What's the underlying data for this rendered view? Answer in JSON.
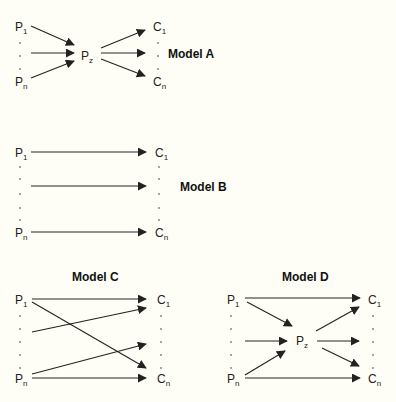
{
  "colors": {
    "background": "#fefef6",
    "ink": "#222222"
  },
  "models": [
    {
      "id": "A",
      "title": "Model A",
      "title_pos": [
        168,
        58
      ],
      "nodes": [
        {
          "id": "P1",
          "main": "P",
          "sub": "1",
          "x": 15,
          "y": 31
        },
        {
          "id": "Pn",
          "main": "P",
          "sub": "n",
          "x": 15,
          "y": 86
        },
        {
          "id": "Pz",
          "main": "P",
          "sub": "z",
          "x": 81,
          "y": 60
        },
        {
          "id": "C1",
          "main": "C",
          "sub": "1",
          "x": 153,
          "y": 31
        },
        {
          "id": "Cn",
          "main": "C",
          "sub": "n",
          "x": 153,
          "y": 86
        }
      ],
      "dots": [
        [
          20,
          43
        ],
        [
          20,
          56
        ],
        [
          20,
          69
        ],
        [
          158,
          43
        ],
        [
          158,
          56
        ],
        [
          158,
          69
        ]
      ],
      "edges": [
        {
          "from": [
            31,
            26
          ],
          "to": [
            74,
            45
          ]
        },
        {
          "from": [
            31,
            53
          ],
          "to": [
            74,
            53
          ]
        },
        {
          "from": [
            31,
            78
          ],
          "to": [
            74,
            61
          ]
        },
        {
          "from": [
            101,
            48
          ],
          "to": [
            145,
            30
          ]
        },
        {
          "from": [
            101,
            53
          ],
          "to": [
            145,
            53
          ]
        },
        {
          "from": [
            101,
            59
          ],
          "to": [
            145,
            76
          ]
        }
      ]
    },
    {
      "id": "B",
      "title": "Model B",
      "title_pos": [
        180,
        191
      ],
      "nodes": [
        {
          "id": "P1",
          "main": "P",
          "sub": "1",
          "x": 15,
          "y": 157
        },
        {
          "id": "Pn",
          "main": "P",
          "sub": "n",
          "x": 15,
          "y": 237
        },
        {
          "id": "C1",
          "main": "C",
          "sub": "1",
          "x": 155,
          "y": 157
        },
        {
          "id": "Cn",
          "main": "C",
          "sub": "n",
          "x": 155,
          "y": 237
        }
      ],
      "dots": [
        [
          20,
          167
        ],
        [
          20,
          179
        ],
        [
          20,
          194
        ],
        [
          20,
          208
        ],
        [
          20,
          220
        ],
        [
          159,
          167
        ],
        [
          159,
          179
        ],
        [
          159,
          194
        ],
        [
          159,
          208
        ],
        [
          159,
          220
        ]
      ],
      "edges": [
        {
          "from": [
            31,
            152
          ],
          "to": [
            146,
            152
          ]
        },
        {
          "from": [
            31,
            186
          ],
          "to": [
            146,
            186
          ]
        },
        {
          "from": [
            31,
            232
          ],
          "to": [
            146,
            232
          ]
        }
      ]
    },
    {
      "id": "C",
      "title": "Model C",
      "title_pos": [
        72,
        281
      ],
      "nodes": [
        {
          "id": "P1",
          "main": "P",
          "sub": "1",
          "x": 15,
          "y": 304
        },
        {
          "id": "Pn",
          "main": "P",
          "sub": "n",
          "x": 15,
          "y": 383
        },
        {
          "id": "C1",
          "main": "C",
          "sub": "1",
          "x": 157,
          "y": 304
        },
        {
          "id": "Cn",
          "main": "C",
          "sub": "n",
          "x": 157,
          "y": 383
        }
      ],
      "dots": [
        [
          20,
          316
        ],
        [
          20,
          329
        ],
        [
          20,
          342
        ],
        [
          20,
          355
        ],
        [
          20,
          368
        ],
        [
          161,
          316
        ],
        [
          161,
          329
        ],
        [
          161,
          342
        ],
        [
          161,
          355
        ],
        [
          161,
          368
        ]
      ],
      "edges": [
        {
          "from": [
            32,
            299
          ],
          "to": [
            146,
            299
          ]
        },
        {
          "from": [
            32,
            302
          ],
          "to": [
            146,
            368
          ]
        },
        {
          "from": [
            32,
            332
          ],
          "to": [
            146,
            308
          ]
        },
        {
          "from": [
            32,
            374
          ],
          "to": [
            146,
            344
          ]
        },
        {
          "from": [
            32,
            378
          ],
          "to": [
            146,
            378
          ]
        }
      ]
    },
    {
      "id": "D",
      "title": "Model D",
      "title_pos": [
        282,
        281
      ],
      "nodes": [
        {
          "id": "P1",
          "main": "P",
          "sub": "1",
          "x": 227,
          "y": 304
        },
        {
          "id": "Pn",
          "main": "P",
          "sub": "n",
          "x": 227,
          "y": 383
        },
        {
          "id": "Pz",
          "main": "P",
          "sub": "z",
          "x": 296,
          "y": 345
        },
        {
          "id": "C1",
          "main": "C",
          "sub": "1",
          "x": 368,
          "y": 304
        },
        {
          "id": "Cn",
          "main": "C",
          "sub": "n",
          "x": 368,
          "y": 383
        }
      ],
      "dots": [
        [
          231,
          316
        ],
        [
          231,
          329
        ],
        [
          231,
          342
        ],
        [
          231,
          355
        ],
        [
          231,
          368
        ],
        [
          373,
          316
        ],
        [
          373,
          329
        ],
        [
          373,
          342
        ],
        [
          373,
          355
        ],
        [
          373,
          368
        ]
      ],
      "edges": [
        {
          "from": [
            245,
            298
          ],
          "to": [
            360,
            298
          ]
        },
        {
          "from": [
            247,
            302
          ],
          "to": [
            292,
            326
          ]
        },
        {
          "from": [
            245,
            341
          ],
          "to": [
            287,
            341
          ]
        },
        {
          "from": [
            245,
            375
          ],
          "to": [
            285,
            351
          ]
        },
        {
          "from": [
            316,
            331
          ],
          "to": [
            359,
            307
          ]
        },
        {
          "from": [
            317,
            341
          ],
          "to": [
            359,
            341
          ]
        },
        {
          "from": [
            322,
            348
          ],
          "to": [
            359,
            366
          ]
        },
        {
          "from": [
            245,
            378
          ],
          "to": [
            360,
            378
          ]
        }
      ]
    }
  ]
}
